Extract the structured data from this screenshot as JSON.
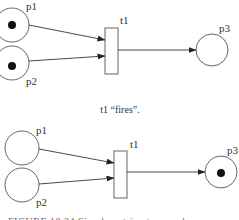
{
  "diagram": {
    "type": "petri-net",
    "colors": {
      "stroke": "#555555",
      "token": "#111111",
      "background": "#ffffff"
    },
    "before": {
      "places": [
        {
          "id": "p1",
          "label": "p1",
          "tokens": 1
        },
        {
          "id": "p2",
          "label": "p2",
          "tokens": 1
        },
        {
          "id": "p3",
          "label": "p3",
          "tokens": 0
        }
      ],
      "transitions": [
        {
          "id": "t1",
          "label": "t1"
        }
      ],
      "arcs": [
        [
          "p1",
          "t1"
        ],
        [
          "p2",
          "t1"
        ],
        [
          "t1",
          "p3"
        ]
      ]
    },
    "caption": "t1 “fires”.",
    "after": {
      "places": [
        {
          "id": "p1",
          "label": "p1",
          "tokens": 0
        },
        {
          "id": "p2",
          "label": "p2",
          "tokens": 0
        },
        {
          "id": "p3",
          "label": "p3",
          "tokens": 1
        }
      ],
      "transitions": [
        {
          "id": "t1",
          "label": "t1"
        }
      ],
      "arcs": [
        [
          "p1",
          "t1"
        ],
        [
          "p2",
          "t1"
        ],
        [
          "t1",
          "p3"
        ]
      ]
    },
    "figure_caption": "FIGURE 10.24   Simple petri net example"
  }
}
